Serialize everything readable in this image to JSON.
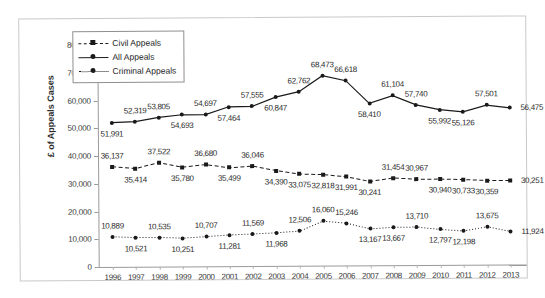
{
  "chart_data": {
    "type": "line",
    "title": "",
    "xlabel": "",
    "ylabel": "£ of Appeals Cases",
    "ylim": [
      0,
      80000
    ],
    "ytick_labels": [
      "80,000",
      "70,000",
      "60,000",
      "50,000",
      "40,000",
      "30,000",
      "20,000",
      "10,000",
      "0"
    ],
    "ytick_values": [
      80000,
      70000,
      60000,
      50000,
      40000,
      30000,
      20000,
      10000,
      0
    ],
    "grid": false,
    "legend_position": "upper-left-inside",
    "categories": [
      1996,
      1997,
      1998,
      1999,
      2000,
      2001,
      2002,
      2003,
      2004,
      2005,
      2006,
      2007,
      2008,
      2009,
      2010,
      2011,
      2012,
      2013
    ],
    "xtick_labels": [
      "1996",
      "1997",
      "1998",
      "1999",
      "2000",
      "2001",
      "2002",
      "2003",
      "2004",
      "2005",
      "2006",
      "2007",
      "2008",
      "2009",
      "2010",
      "2011",
      "2012",
      "2013"
    ],
    "series": [
      {
        "name": "All Appeals",
        "style": "solid",
        "marker": "circle",
        "values": [
          51991,
          52319,
          53805,
          54693,
          54697,
          57464,
          57555,
          60847,
          62762,
          68473,
          66618,
          58410,
          61104,
          57740,
          55992,
          55126,
          57501,
          56475
        ],
        "labels": [
          "51,991",
          "52,319",
          "53,805",
          "54,693",
          "54,697",
          "57,464",
          "57,555",
          "60,847",
          "62,762",
          "68,473",
          "66,618",
          "58,410",
          "61,104",
          "57,740",
          "55,992",
          "55,126",
          "57,501",
          "56,475"
        ],
        "label_side": [
          "below",
          "above",
          "above",
          "below",
          "above",
          "below",
          "above",
          "below",
          "above",
          "above",
          "above",
          "below",
          "above",
          "above",
          "below",
          "below",
          "above",
          "right"
        ]
      },
      {
        "name": "Civil Appeals",
        "style": "dashed",
        "marker": "square",
        "values": [
          36137,
          35414,
          37522,
          35780,
          36680,
          35499,
          36046,
          34390,
          33075,
          32818,
          31991,
          30241,
          31454,
          30967,
          30940,
          30733,
          30359,
          30251
        ],
        "labels": [
          "36,137",
          "35,414",
          "37,522",
          "35,780",
          "36,680",
          "35,499",
          "36,046",
          "34,390",
          "33,075",
          "32,818",
          "31,991",
          "30,241",
          "31,454",
          "30,967",
          "30,940",
          "30,733",
          "30,359",
          "30,251"
        ],
        "label_side": [
          "above",
          "below",
          "above",
          "below",
          "above",
          "below",
          "above",
          "below",
          "below",
          "below",
          "below",
          "below",
          "above",
          "above",
          "below",
          "below",
          "below",
          "right"
        ]
      },
      {
        "name": "Criminal Appeals",
        "style": "dotted",
        "marker": "circle",
        "values": [
          10889,
          10521,
          10535,
          10251,
          10707,
          11281,
          11569,
          11968,
          12506,
          16060,
          15246,
          13167,
          13667,
          13710,
          12797,
          12198,
          13675,
          11924
        ],
        "labels": [
          "10,889",
          "10,521",
          "10,535",
          "10,251",
          "10,707",
          "11,281",
          "11,569",
          "11,968",
          "12,506",
          "16,060",
          "15,246",
          "13,167",
          "13,667",
          "13,710",
          "12,797",
          "12,198",
          "13,675",
          "11,924"
        ],
        "label_side": [
          "above",
          "below",
          "above",
          "below",
          "above",
          "below",
          "above",
          "below",
          "above",
          "above",
          "above",
          "below",
          "below",
          "above",
          "below",
          "below",
          "above",
          "right"
        ]
      }
    ]
  },
  "legend": {
    "items": [
      {
        "label": "Civil Appeals"
      },
      {
        "label": "All Appeals"
      },
      {
        "label": "Criminal Appeals"
      }
    ]
  }
}
